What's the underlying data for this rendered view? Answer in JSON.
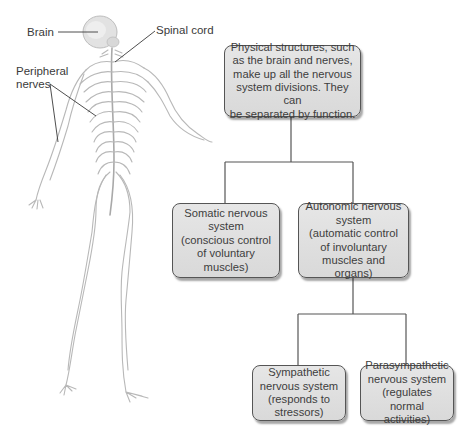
{
  "labels": {
    "brain": "Brain",
    "spinal_cord": "Spinal cord",
    "peripheral_nerves_line1": "Peripheral",
    "peripheral_nerves_line2": "nerves"
  },
  "tree": {
    "root": {
      "lines": [
        "Physical structures, such",
        "as the brain and nerves,",
        "make up all the nervous",
        "system divisions. They can",
        "be separated by function."
      ]
    },
    "somatic": {
      "lines": [
        "Somatic nervous",
        "system",
        "(conscious control",
        "of voluntary",
        "muscles)"
      ]
    },
    "autonomic": {
      "lines": [
        "Autonomic nervous",
        "system",
        "(automatic control",
        "of involuntary",
        "muscles and organs)"
      ]
    },
    "sympathetic": {
      "lines": [
        "Sympathetic",
        "nervous system",
        "(responds to",
        "stressors)"
      ]
    },
    "parasympathetic": {
      "lines": [
        "Parasympathetic",
        "nervous system",
        "(regulates normal",
        "activities)"
      ]
    }
  },
  "colors": {
    "box_fill": "#dedede",
    "box_border": "#555555",
    "connector": "#555555",
    "nerve": "#b5b5b5",
    "text": "#3a3a3a"
  }
}
